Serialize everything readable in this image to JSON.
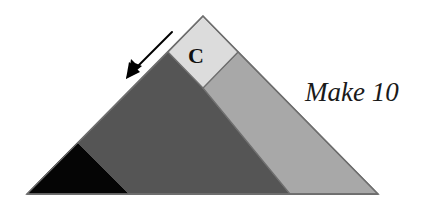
{
  "figure": {
    "title_annotation": "Make 10",
    "cell_label": "C",
    "canvas": {
      "width": 424,
      "height": 208,
      "background": "#ffffff"
    },
    "colors": {
      "light_gray": "#dcdcdc",
      "medium_gray": "#a8a8a8",
      "dark_gray": "#555555",
      "black": "#050505",
      "outline": "#6e6e6e",
      "arrow": "#000000",
      "text": "#1a1a1a"
    },
    "geometry": {
      "triangle_apex": [
        203,
        16
      ],
      "triangle_bottom_left": [
        27,
        194
      ],
      "triangle_bottom_right": [
        378,
        194
      ],
      "square_points": [
        [
          203,
          16
        ],
        [
          168,
          52
        ],
        [
          203,
          88
        ],
        [
          238,
          52
        ]
      ],
      "medium_band_points": [
        [
          238,
          52
        ],
        [
          378,
          194
        ],
        [
          290,
          194
        ],
        [
          203,
          88
        ]
      ],
      "dark_region_points": [
        [
          168,
          52
        ],
        [
          203,
          88
        ],
        [
          290,
          194
        ],
        [
          27,
          194
        ]
      ],
      "black_triangle_points": [
        [
          27,
          194
        ],
        [
          77,
          143
        ],
        [
          128,
          194
        ]
      ],
      "arrow_tail": [
        172,
        32
      ],
      "arrow_head": [
        128,
        76
      ]
    },
    "parts": [
      {
        "name": "square-c",
        "shade": "light_gray",
        "label": "C"
      },
      {
        "name": "right-band",
        "shade": "medium_gray",
        "label": ""
      },
      {
        "name": "left-body",
        "shade": "dark_gray",
        "label": ""
      },
      {
        "name": "corner-wedge",
        "shade": "black",
        "label": ""
      }
    ],
    "icons": {
      "arrow": "arrow-down-left-icon"
    }
  }
}
